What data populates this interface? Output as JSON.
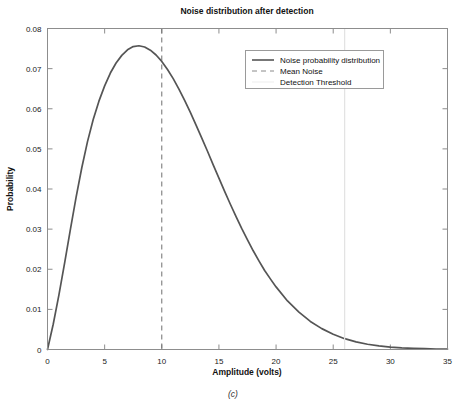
{
  "chart_data": {
    "type": "line",
    "title": "Noise distribution after detection",
    "xlabel": "Amplitude (volts)",
    "ylabel": "Probability",
    "caption": "(c)",
    "xlim": [
      0,
      35
    ],
    "ylim": [
      0,
      0.08
    ],
    "xticks": [
      0,
      5,
      10,
      15,
      20,
      25,
      30,
      35
    ],
    "xtick_labels": [
      "0",
      "5",
      "10",
      "15",
      "20",
      "25",
      "30",
      "35"
    ],
    "yticks": [
      0,
      0.01,
      0.02,
      0.03,
      0.04,
      0.05,
      0.06,
      0.07,
      0.08
    ],
    "ytick_labels": [
      "0",
      "0.01",
      "0.02",
      "0.03",
      "0.04",
      "0.05",
      "0.06",
      "0.07",
      "0.08"
    ],
    "grid": false,
    "legend_position": "upper-right-inside",
    "series": [
      {
        "name": "Noise probability distribution",
        "type": "line",
        "style": "solid",
        "color": "#555555",
        "x": [
          0,
          0.5,
          1,
          1.5,
          2,
          2.5,
          3,
          3.5,
          4,
          4.5,
          5,
          5.5,
          6,
          6.5,
          7,
          7.5,
          8,
          8.5,
          9,
          9.5,
          10,
          10.5,
          11,
          11.5,
          12,
          12.5,
          13,
          13.5,
          14,
          14.5,
          15,
          15.5,
          16,
          16.5,
          17,
          17.5,
          18,
          18.5,
          19,
          19.5,
          20,
          21,
          22,
          23,
          24,
          25,
          26,
          27,
          28,
          29,
          30,
          31,
          32,
          33,
          34,
          35
        ],
        "y": [
          0.0,
          0.0063,
          0.0136,
          0.0216,
          0.0299,
          0.0379,
          0.0453,
          0.0518,
          0.0573,
          0.0619,
          0.0657,
          0.0689,
          0.0714,
          0.0733,
          0.0747,
          0.0755,
          0.0757,
          0.0754,
          0.0746,
          0.0734,
          0.0718,
          0.0698,
          0.0675,
          0.0649,
          0.0621,
          0.0591,
          0.0559,
          0.0527,
          0.0494,
          0.046,
          0.0427,
          0.0394,
          0.0362,
          0.0331,
          0.0301,
          0.0273,
          0.0246,
          0.0221,
          0.0197,
          0.0176,
          0.0156,
          0.0121,
          0.0093,
          0.007,
          0.0052,
          0.0038,
          0.0027,
          0.0019,
          0.0013,
          0.0009,
          0.0006,
          0.0004,
          0.0003,
          0.0002,
          0.0001,
          0.0001
        ]
      },
      {
        "name": "Mean Noise",
        "type": "vline",
        "style": "dashed",
        "color": "#6f6f6f",
        "x_value": 10
      },
      {
        "name": "Detection Threshold",
        "type": "vline",
        "style": "solid-faint",
        "color": "#e2e2e2",
        "x_value": 26
      }
    ]
  },
  "legend": {
    "entries": [
      {
        "label": "Noise probability distribution"
      },
      {
        "label": "Mean Noise"
      },
      {
        "label": "Detection Threshold"
      }
    ]
  },
  "colors": {
    "curve": "#555555",
    "mean_line": "#6f6f6f",
    "threshold_line": "#e2e2e2",
    "axis": "#8d8d8d",
    "text": "#111111",
    "background": "#ffffff"
  }
}
